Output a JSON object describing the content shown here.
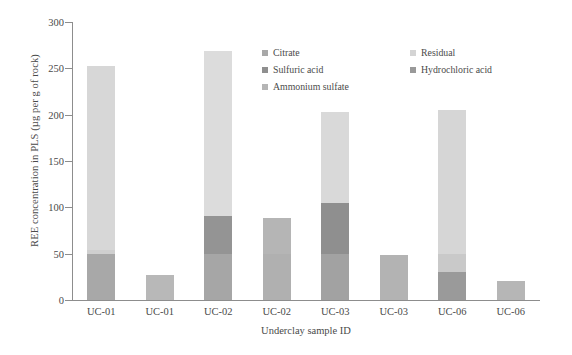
{
  "chart_data": {
    "type": "bar",
    "subtype": "stacked-bar",
    "title": "",
    "xlabel": "Underclay sample ID",
    "ylabel": "REE concentration in PLS (µg per g of rock)",
    "ylim": [
      0,
      300
    ],
    "yticks": [
      0,
      50,
      100,
      150,
      200,
      250,
      300
    ],
    "ytick_labels": [
      "0",
      "50",
      "100",
      "150",
      "200",
      "250",
      "300"
    ],
    "grid": false,
    "legend_position": "top-right-inside",
    "categories": [
      "UC-01",
      "UC-01",
      "UC-02",
      "UC-02",
      "UC-03",
      "UC-03",
      "UC-06",
      "UC-06"
    ],
    "series": [
      {
        "name": "Citrate",
        "color": "#a8a8a8",
        "values": [
          50,
          0,
          50,
          50,
          50,
          0,
          0,
          0
        ]
      },
      {
        "name": "Sulfuric acid",
        "color": "#8f8f8f",
        "values": [
          4,
          0,
          41,
          39,
          55,
          0,
          0,
          0
        ]
      },
      {
        "name": "Ammonium sulfate",
        "color": "#b5b5b5",
        "values": [
          0,
          27,
          0,
          0,
          0,
          49,
          20,
          20
        ]
      },
      {
        "name": "Residual",
        "color": "#d9d9d9",
        "values": [
          199,
          0,
          178,
          0,
          98,
          0,
          155,
          0
        ]
      },
      {
        "name": "Hydrochloric acid",
        "color": "#999999",
        "values": [
          0,
          0,
          0,
          0,
          0,
          0,
          30,
          0
        ]
      }
    ],
    "bar_totals": [
      253,
      27,
      269,
      89,
      203,
      49,
      205,
      20
    ],
    "bars": [
      {
        "label": "UC-01",
        "total": 253,
        "segments": [
          {
            "series": "Citrate",
            "from": 0,
            "to": 50,
            "value": 50,
            "color": "#a8a8a8"
          },
          {
            "series": "Sulfuric acid",
            "from": 50,
            "to": 54,
            "value": 4,
            "color": "#cfcfcf"
          },
          {
            "series": "Residual",
            "from": 54,
            "to": 253,
            "value": 199,
            "color": "#d7d7d7"
          }
        ]
      },
      {
        "label": "UC-01",
        "total": 27,
        "segments": [
          {
            "series": "Ammonium sulfate",
            "from": 0,
            "to": 27,
            "value": 27,
            "color": "#b8b8b8"
          }
        ]
      },
      {
        "label": "UC-02",
        "total": 269,
        "segments": [
          {
            "series": "Citrate",
            "from": 0,
            "to": 50,
            "value": 50,
            "color": "#a6a6a6"
          },
          {
            "series": "Sulfuric acid",
            "from": 50,
            "to": 91,
            "value": 41,
            "color": "#949494"
          },
          {
            "series": "Residual",
            "from": 91,
            "to": 269,
            "value": 178,
            "color": "#dcdcdc"
          }
        ]
      },
      {
        "label": "UC-02",
        "total": 89,
        "segments": [
          {
            "series": "Citrate",
            "from": 0,
            "to": 50,
            "value": 50,
            "color": "#b0b0b0"
          },
          {
            "series": "Sulfuric acid",
            "from": 50,
            "to": 89,
            "value": 39,
            "color": "#b5b5b5"
          }
        ]
      },
      {
        "label": "UC-03",
        "total": 203,
        "segments": [
          {
            "series": "Citrate",
            "from": 0,
            "to": 50,
            "value": 50,
            "color": "#a2a2a2"
          },
          {
            "series": "Sulfuric acid",
            "from": 50,
            "to": 105,
            "value": 55,
            "color": "#8f8f8f"
          },
          {
            "series": "Residual",
            "from": 105,
            "to": 203,
            "value": 98,
            "color": "#d9d9d9"
          }
        ]
      },
      {
        "label": "UC-03",
        "total": 49,
        "segments": [
          {
            "series": "Ammonium sulfate",
            "from": 0,
            "to": 49,
            "value": 49,
            "color": "#b3b3b3"
          }
        ]
      },
      {
        "label": "UC-06",
        "total": 205,
        "segments": [
          {
            "series": "Hydrochloric acid",
            "from": 0,
            "to": 30,
            "value": 30,
            "color": "#9a9a9a"
          },
          {
            "series": "Ammonium sulfate",
            "from": 30,
            "to": 50,
            "value": 20,
            "color": "#c9c9c9"
          },
          {
            "series": "Residual",
            "from": 50,
            "to": 205,
            "value": 155,
            "color": "#d6d6d6"
          }
        ]
      },
      {
        "label": "UC-06",
        "total": 20,
        "segments": [
          {
            "series": "Ammonium sulfate",
            "from": 0,
            "to": 20,
            "value": 20,
            "color": "#b6b6b6"
          }
        ]
      }
    ],
    "legend": {
      "column_1": [
        {
          "label": "Citrate",
          "color": "#a8a8a8"
        },
        {
          "label": "Sulfuric acid",
          "color": "#8f8f8f"
        },
        {
          "label": "Ammonium sulfate",
          "color": "#b5b5b5"
        }
      ],
      "column_2": [
        {
          "label": "Residual",
          "color": "#d4d4d4"
        },
        {
          "label": "Hydrochloric acid",
          "color": "#999999"
        }
      ]
    },
    "colors": {
      "axis": "#8d8d8d",
      "text": "#4a4a4a",
      "background": "#ffffff"
    }
  }
}
